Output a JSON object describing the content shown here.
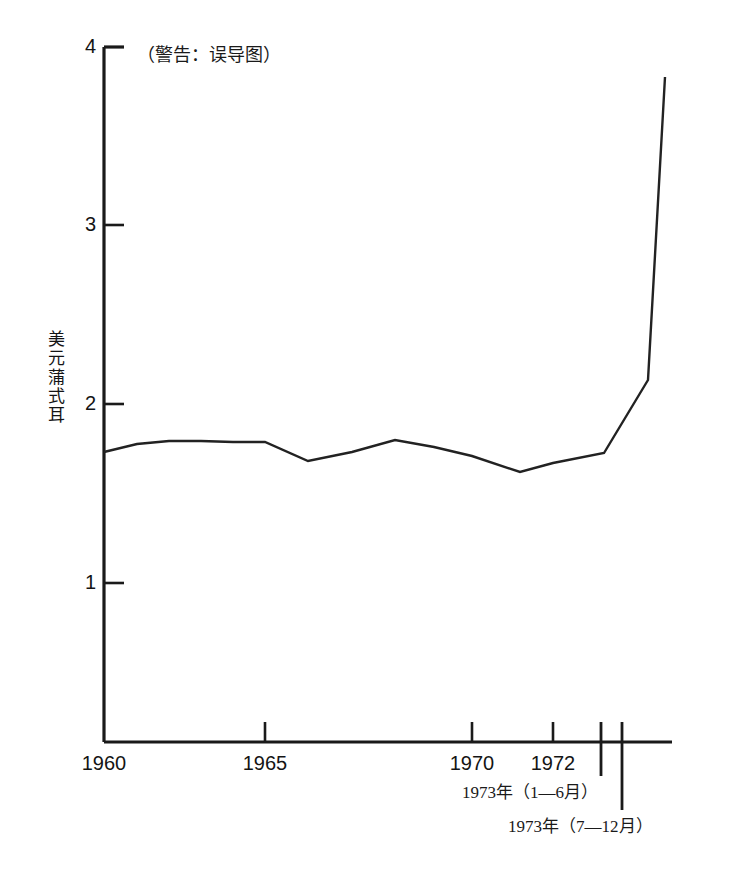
{
  "chart_data": {
    "type": "line",
    "title": "",
    "annotation": "（警告：误导图）",
    "xlabel": "",
    "ylabel": "美元蒲式耳",
    "ylim": [
      0.47,
      4.0
    ],
    "xlim": [
      1960,
      1973.95
    ],
    "yticks": [
      4,
      3,
      2,
      1
    ],
    "ytick_labels": [
      "4",
      "3",
      "2",
      "1"
    ],
    "xticks": [
      1960,
      1965,
      1970,
      1972
    ],
    "xtick_labels": [
      "1960",
      "1965",
      "1970",
      "1972"
    ],
    "extra_xticks": [
      1973.45,
      1974.0
    ],
    "grid": false,
    "legend": null,
    "series": [
      {
        "name": "小麦价格",
        "x": [
          1960,
          1961,
          1962,
          1963,
          1964,
          1965,
          1966,
          1967,
          1968,
          1969,
          1970,
          1971,
          1972,
          1973.45,
          1973.95
        ],
        "values": [
          1.73,
          1.78,
          1.8,
          1.8,
          1.79,
          1.79,
          1.68,
          1.73,
          1.8,
          1.76,
          1.7,
          1.62,
          1.66,
          1.73,
          2.13
        ],
        "color": "#222222"
      }
    ],
    "points_px": [
      [
        104,
        452
      ],
      [
        137,
        444
      ],
      [
        169,
        441
      ],
      [
        201,
        441
      ],
      [
        233,
        442
      ],
      [
        265,
        442
      ],
      [
        308,
        461
      ],
      [
        352,
        452
      ],
      [
        395,
        440
      ],
      [
        434,
        447
      ],
      [
        472,
        456
      ],
      [
        520,
        472
      ],
      [
        553,
        463
      ],
      [
        604,
        453
      ],
      [
        648,
        380
      ],
      [
        665,
        77
      ]
    ],
    "period_labels": [
      {
        "id": "period-1973-h1",
        "text": "1973年（1—6月）"
      },
      {
        "id": "period-1973-h2",
        "text": "1973年（7—12月）"
      }
    ],
    "peak_value": 3.83,
    "peak_label": "",
    "axis_color": "#1a1a1a",
    "line_color": "#222222",
    "background": "#ffffff"
  }
}
